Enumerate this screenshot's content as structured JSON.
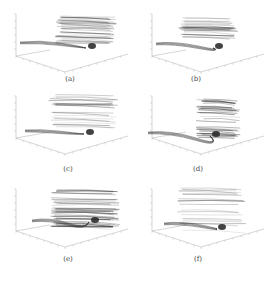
{
  "figure": {
    "panels": [
      {
        "id": "a",
        "label": "(a)",
        "density": 0.8,
        "blob": [
          92,
          46
        ],
        "cloud": [
          55,
          15,
          62,
          28
        ],
        "tail": [
          [
            20,
            42
          ],
          [
            40,
            40
          ],
          [
            60,
            43
          ]
        ]
      },
      {
        "id": "b",
        "label": "(b)",
        "density": 0.65,
        "blob": [
          83,
          46
        ],
        "cloud": [
          42,
          15,
          60,
          28
        ],
        "tail": [
          [
            20,
            43
          ],
          [
            38,
            41
          ],
          [
            62,
            46
          ]
        ]
      },
      {
        "id": "c",
        "label": "(c)",
        "density": 0.55,
        "blob": [
          90,
          38
        ],
        "cloud": [
          48,
          0,
          70,
          36
        ],
        "tail": [
          [
            25,
            36
          ],
          [
            40,
            35
          ],
          [
            58,
            37
          ]
        ]
      },
      {
        "id": "d",
        "label": "(d)",
        "density": 0.9,
        "blob": [
          80,
          40
        ],
        "cloud": [
          60,
          4,
          45,
          40
        ],
        "tail": [
          [
            12,
            38
          ],
          [
            35,
            36
          ],
          [
            60,
            44
          ]
        ]
      },
      {
        "id": "e",
        "label": "(e)",
        "density": 1.0,
        "blob": [
          95,
          33
        ],
        "cloud": [
          50,
          0,
          70,
          40
        ],
        "tail": [
          [
            32,
            33
          ],
          [
            50,
            30
          ],
          [
            68,
            36
          ]
        ]
      },
      {
        "id": "f",
        "label": "(f)",
        "density": 0.5,
        "blob": [
          86,
          40
        ],
        "cloud": [
          40,
          0,
          70,
          44
        ],
        "tail": [
          [
            28,
            36
          ],
          [
            45,
            34
          ],
          [
            65,
            38
          ]
        ]
      }
    ],
    "colors": {
      "ink": "#222222",
      "axis": "#bbbbbb",
      "label": "#444444"
    }
  }
}
